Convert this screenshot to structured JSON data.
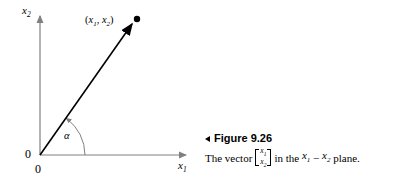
{
  "figure": {
    "caption_marker": "left-triangle",
    "title": "Figure 9.26",
    "body_prefix": "The vector",
    "matrix_row1": "x1",
    "matrix_row2": "x2",
    "body_middle": "in the",
    "body_var1": "x1",
    "body_operator": "−",
    "body_var2": "x2",
    "body_suffix": "plane."
  },
  "diagram": {
    "type": "vector-plot",
    "axis_y_label": "x2",
    "axis_x_label": "x1",
    "origin_label_y": "0",
    "origin_label_x": "0",
    "point_label": "(x1, x2)",
    "angle_label": "α",
    "colors": {
      "axis": "#808080",
      "vector": "#000000",
      "arc": "#808080",
      "background": "#ffffff"
    },
    "geometry": {
      "origin": [
        40,
        155
      ],
      "y_axis_top": [
        40,
        13
      ],
      "x_axis_right": [
        190,
        155
      ],
      "vector_tip": [
        136,
        20
      ],
      "arc_radius": 45,
      "angle_degrees": 55
    }
  }
}
